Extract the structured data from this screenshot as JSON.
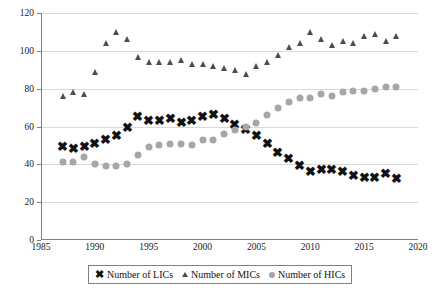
{
  "chart_data": {
    "type": "scatter",
    "title": "",
    "xlabel": "",
    "ylabel": "",
    "xlim": [
      1985,
      2020
    ],
    "ylim": [
      0,
      120
    ],
    "yticks": [
      0,
      20,
      40,
      60,
      80,
      100,
      120
    ],
    "xticks": [
      1985,
      1990,
      1995,
      2000,
      2005,
      2010,
      2015,
      2020
    ],
    "grid": true,
    "legend_position": "bottom",
    "x": [
      1987,
      1988,
      1989,
      1990,
      1991,
      1992,
      1993,
      1994,
      1995,
      1996,
      1997,
      1998,
      1999,
      2000,
      2001,
      2002,
      2003,
      2004,
      2005,
      2006,
      2007,
      2008,
      2009,
      2010,
      2011,
      2012,
      2013,
      2014,
      2015,
      2016,
      2017,
      2018
    ],
    "series": [
      {
        "name": "Number of LICs",
        "marker": "x",
        "color": "#111111",
        "values": [
          49,
          48,
          49,
          51,
          53,
          55,
          59,
          65,
          63,
          63,
          64,
          62,
          63,
          65,
          66,
          64,
          61,
          58,
          55,
          51,
          46,
          43,
          39,
          36,
          37,
          37,
          36,
          34,
          33,
          33,
          35,
          32
        ]
      },
      {
        "name": "Number of MICs",
        "marker": "triangle",
        "color": "#4d4d4d",
        "values": [
          76,
          78,
          77,
          89,
          104,
          110,
          106,
          97,
          94,
          94,
          94,
          95,
          93,
          93,
          92,
          91,
          90,
          88,
          92,
          94,
          98,
          102,
          104,
          110,
          106,
          103,
          105,
          104,
          108,
          109,
          105,
          108
        ]
      },
      {
        "name": "Number of HICs",
        "marker": "circle",
        "color": "#a6a6a6",
        "values": [
          41,
          41,
          44,
          40,
          39,
          39,
          40,
          45,
          49,
          50,
          51,
          51,
          50,
          53,
          53,
          56,
          58,
          60,
          62,
          66,
          70,
          73,
          75,
          75,
          77,
          76,
          78,
          79,
          79,
          80,
          81,
          81
        ]
      }
    ]
  },
  "legend": {
    "items": [
      {
        "label": "Number of LICs",
        "glyph": "x-marker-icon"
      },
      {
        "label": "Number of MICs",
        "glyph": "triangle-marker-icon"
      },
      {
        "label": "Number of HICs",
        "glyph": "circle-marker-icon"
      }
    ]
  },
  "axes": {
    "y_labels": [
      "0",
      "20",
      "40",
      "60",
      "80",
      "100",
      "120"
    ],
    "x_labels": [
      "1985",
      "1990",
      "1995",
      "2000",
      "2005",
      "2010",
      "2015",
      "2020"
    ]
  }
}
